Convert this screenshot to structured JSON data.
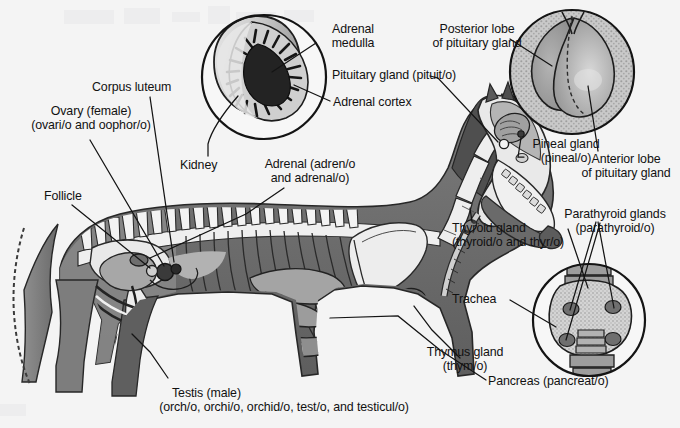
{
  "figure": {
    "background_color": "#f4f4f4",
    "text_color": "#111111",
    "line_color": "#1a1a1a"
  },
  "labels": {
    "adrenal_medulla": {
      "line1": "Adrenal",
      "line2": "medulla"
    },
    "adrenal_cortex": {
      "line1": "Adrenal cortex"
    },
    "pituitary_gland": {
      "line1": "Pituitary gland (pituit/o)"
    },
    "posterior_lobe": {
      "line1": "Posterior lobe",
      "line2": "of pituitary gland"
    },
    "anterior_lobe": {
      "line1": "Anterior lobe",
      "line2": "of pituitary gland"
    },
    "pineal_gland": {
      "line1": "Pineal gland",
      "line2": "(pineal/o)"
    },
    "corpus_luteum": {
      "line1": "Corpus luteum"
    },
    "ovary": {
      "line1": "Ovary (female)",
      "line2": "(ovari/o and oophor/o)"
    },
    "follicle": {
      "line1": "Follicle"
    },
    "kidney": {
      "line1": "Kidney"
    },
    "adrenal": {
      "line1": "Adrenal (adren/o",
      "line2": "and adrenal/o)"
    },
    "thyroid_gland": {
      "line1": "Thyroid gland",
      "line2": "(thyroid/o and thyr/o)"
    },
    "parathyroid_glands": {
      "line1": "Parathyroid glands",
      "line2": "(parathyroid/o)"
    },
    "trachea": {
      "line1": "Trachea"
    },
    "thymus_gland": {
      "line1": "Thymus gland",
      "line2": "(thym/o)"
    },
    "pancreas": {
      "line1": "Pancreas (pancreat/o)"
    },
    "testis": {
      "line1": "Testis (male)",
      "line2": "(orch/o, orchi/o, orchid/o, test/o, and testicul/o)"
    }
  },
  "insets": {
    "adrenal_kidney": {
      "name": "kidney-adrenal-cross-section",
      "cx": 264,
      "cy": 77,
      "r": 62
    },
    "pituitary": {
      "name": "pituitary-gland-cross-section",
      "cx": 572,
      "cy": 72,
      "r": 62
    },
    "thyroid": {
      "name": "thyroid-parathyroid-detail",
      "cx": 589,
      "cy": 320,
      "r": 56
    }
  },
  "palette": {
    "body_dark": "#6b6b6b",
    "body_mid": "#8f8f8f",
    "body_light": "#b8b8b8",
    "bone_light": "#f0f0f0",
    "bone_shadow": "#cfcfcf",
    "organ_gray": "#9a9a9a",
    "dark_accent": "#4a4a4a",
    "near_black": "#232323",
    "stipple": "#bdbdbd"
  }
}
